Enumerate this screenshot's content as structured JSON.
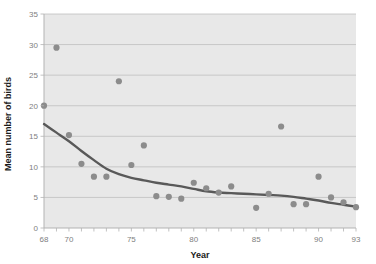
{
  "chart_data": {
    "type": "scatter",
    "title": "",
    "xlabel": "Year",
    "ylabel": "Mean number of birds",
    "xlim": [
      68,
      93
    ],
    "ylim": [
      0,
      35
    ],
    "grid": "horizontal",
    "legend": "none",
    "x_ticks": [
      68,
      70,
      75,
      80,
      85,
      90,
      93
    ],
    "x_tick_labels": [
      "68",
      "70",
      "75",
      "80",
      "85",
      "90",
      "93"
    ],
    "y_ticks": [
      0,
      5,
      10,
      15,
      20,
      25,
      30,
      35
    ],
    "y_tick_labels": [
      "0",
      "5",
      "10",
      "15",
      "20",
      "25",
      "30",
      "35"
    ],
    "x_minor_tick_step": 1,
    "series": [
      {
        "name": "Mean number of birds",
        "type": "scatter",
        "marker": "circle",
        "color": "#8c8c8c",
        "points": [
          {
            "x": 68,
            "y": 20.0
          },
          {
            "x": 69,
            "y": 29.5
          },
          {
            "x": 70,
            "y": 15.2
          },
          {
            "x": 71,
            "y": 10.5
          },
          {
            "x": 72,
            "y": 8.4
          },
          {
            "x": 73,
            "y": 8.4
          },
          {
            "x": 74,
            "y": 24.0
          },
          {
            "x": 75,
            "y": 10.3
          },
          {
            "x": 76,
            "y": 13.5
          },
          {
            "x": 77,
            "y": 5.2
          },
          {
            "x": 78,
            "y": 5.1
          },
          {
            "x": 79,
            "y": 4.8
          },
          {
            "x": 80,
            "y": 7.4
          },
          {
            "x": 81,
            "y": 6.5
          },
          {
            "x": 82,
            "y": 5.8
          },
          {
            "x": 83,
            "y": 6.8
          },
          {
            "x": 85,
            "y": 3.3
          },
          {
            "x": 86,
            "y": 5.6
          },
          {
            "x": 87,
            "y": 16.6
          },
          {
            "x": 88,
            "y": 3.9
          },
          {
            "x": 89,
            "y": 3.9
          },
          {
            "x": 90,
            "y": 8.4
          },
          {
            "x": 91,
            "y": 5.0
          },
          {
            "x": 92,
            "y": 4.2
          },
          {
            "x": 93,
            "y": 3.4
          }
        ]
      },
      {
        "name": "Trend line",
        "type": "line",
        "color": "#595959",
        "points": [
          {
            "x": 68.0,
            "y": 17.0
          },
          {
            "x": 69.0,
            "y": 15.6
          },
          {
            "x": 70.0,
            "y": 14.2
          },
          {
            "x": 71.0,
            "y": 12.6
          },
          {
            "x": 72.0,
            "y": 11.1
          },
          {
            "x": 73.0,
            "y": 9.7
          },
          {
            "x": 74.0,
            "y": 8.8
          },
          {
            "x": 75.0,
            "y": 8.2
          },
          {
            "x": 76.0,
            "y": 7.8
          },
          {
            "x": 77.0,
            "y": 7.4
          },
          {
            "x": 78.0,
            "y": 7.1
          },
          {
            "x": 79.0,
            "y": 6.8
          },
          {
            "x": 80.0,
            "y": 6.4
          },
          {
            "x": 81.0,
            "y": 6.0
          },
          {
            "x": 82.0,
            "y": 5.8
          },
          {
            "x": 83.0,
            "y": 5.7
          },
          {
            "x": 84.0,
            "y": 5.6
          },
          {
            "x": 85.0,
            "y": 5.5
          },
          {
            "x": 86.0,
            "y": 5.4
          },
          {
            "x": 87.0,
            "y": 5.3
          },
          {
            "x": 88.0,
            "y": 5.1
          },
          {
            "x": 89.0,
            "y": 4.8
          },
          {
            "x": 90.0,
            "y": 4.5
          },
          {
            "x": 91.0,
            "y": 4.1
          },
          {
            "x": 92.0,
            "y": 3.8
          },
          {
            "x": 93.0,
            "y": 3.5
          }
        ]
      }
    ],
    "colors": {
      "plot_background": "#e8e8e8",
      "gridline": "#bfbfbf",
      "axis_line": "#b3b3b3",
      "marker": "#8c8c8c",
      "trend_line": "#595959",
      "tick_label": "#808080",
      "axis_title": "#1a1a1a",
      "page_background": "#ffffff"
    }
  }
}
